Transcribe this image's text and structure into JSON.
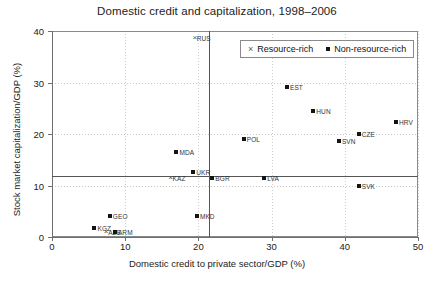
{
  "chart_data": {
    "type": "scatter",
    "title": "Domestic credit and capitalization, 1998–2006",
    "xlabel": "Domestic credit to private sector/GDP (%)",
    "ylabel": "Stock market capitalization/GDP (%)",
    "xlim": [
      0,
      50
    ],
    "ylim": [
      0,
      40
    ],
    "xticks": [
      0,
      10,
      20,
      30,
      40,
      50
    ],
    "yticks": [
      0,
      10,
      20,
      30,
      40
    ],
    "grid": true,
    "legend_position": "top-right",
    "reference_lines": {
      "vertical_x": 21.5,
      "horizontal_y": 11.8
    },
    "legend": [
      {
        "name": "Resource-rich",
        "marker": "x"
      },
      {
        "name": "Non-resource-rich",
        "marker": "square"
      }
    ],
    "series": [
      {
        "name": "Resource-rich",
        "marker": "x",
        "points": [
          {
            "label": "RUS",
            "x": 19.5,
            "y": 38.6
          },
          {
            "label": "KAZ",
            "x": 16.2,
            "y": 11.4
          },
          {
            "label": "AZE",
            "x": 7.4,
            "y": 1.0
          }
        ]
      },
      {
        "name": "Non-resource-rich",
        "marker": "square",
        "points": [
          {
            "label": "EST",
            "x": 32.1,
            "y": 29.2
          },
          {
            "label": "HUN",
            "x": 35.7,
            "y": 24.5
          },
          {
            "label": "CZE",
            "x": 41.9,
            "y": 20.0
          },
          {
            "label": "HRV",
            "x": 47.0,
            "y": 22.4
          },
          {
            "label": "POL",
            "x": 26.2,
            "y": 19.0
          },
          {
            "label": "SVN",
            "x": 39.2,
            "y": 18.6
          },
          {
            "label": "MDA",
            "x": 17.0,
            "y": 16.5
          },
          {
            "label": "UKR",
            "x": 19.3,
            "y": 12.7
          },
          {
            "label": "BGR",
            "x": 21.9,
            "y": 11.4
          },
          {
            "label": "LVA",
            "x": 29.0,
            "y": 11.4
          },
          {
            "label": "SVK",
            "x": 41.9,
            "y": 10.0
          },
          {
            "label": "GEO",
            "x": 7.9,
            "y": 4.0
          },
          {
            "label": "MKD",
            "x": 19.8,
            "y": 4.0
          },
          {
            "label": "KGZ",
            "x": 5.8,
            "y": 1.8
          },
          {
            "label": "ARM",
            "x": 8.6,
            "y": 1.0
          }
        ]
      }
    ]
  }
}
